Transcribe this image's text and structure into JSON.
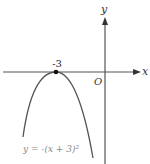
{
  "figure": {
    "axes": {
      "x_label": "x",
      "y_label": "y",
      "origin_label": "O"
    },
    "vertex": {
      "label": "-3",
      "x": -3,
      "y": 0
    },
    "curve": {
      "equation": "y = -(x + 3)²",
      "type": "downward parabola",
      "color": "#555555"
    },
    "colors": {
      "axis": "#555555",
      "curve": "#555555",
      "label": "#333333",
      "equation_label": "#888888"
    }
  }
}
